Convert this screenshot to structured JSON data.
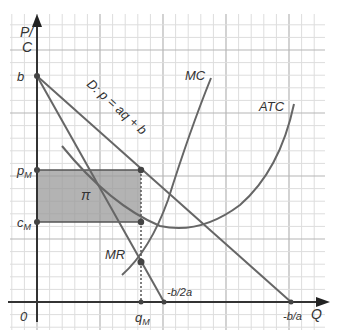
{
  "axes": {
    "y_label_line1": "P/",
    "y_label_line2": "C",
    "x_label": "Q",
    "origin_label": "0"
  },
  "labels": {
    "b": "b",
    "p_m": "p",
    "p_m_sub": "M",
    "c_m": "c",
    "c_m_sub": "M",
    "q_m": "q",
    "q_m_sub": "M",
    "neg_b_2a": "-b/2a",
    "neg_b_a": "-b/a",
    "profit": "π",
    "demand": "D: p = aq + b",
    "mc": "MC",
    "atc": "ATC",
    "mr": "MR"
  },
  "colors": {
    "curve": "#555555",
    "axis": "#333333",
    "grid_minor": "#dddddd",
    "grid_major": "#b5b5b5",
    "profit_fill": "#9a9a9a",
    "point": "#444444"
  },
  "chart_data": {
    "type": "line",
    "title": "",
    "xlabel": "Q",
    "ylabel": "P/C",
    "x_ticks": [
      "0",
      "q_M",
      "-b/2a",
      "-b/a"
    ],
    "y_ticks": [
      "b",
      "p_M",
      "c_M"
    ],
    "series": [
      {
        "name": "D: p = aq + b",
        "kind": "linear",
        "from": [
          "0",
          "b"
        ],
        "to": [
          "-b/a",
          "0"
        ]
      },
      {
        "name": "MR",
        "kind": "linear",
        "from": [
          "0",
          "b"
        ],
        "to": [
          "-b/2a",
          "0"
        ]
      },
      {
        "name": "MC",
        "kind": "curve",
        "note": "upward sloping, intersects MR at q_M"
      },
      {
        "name": "ATC",
        "kind": "curve",
        "note": "U-shaped, value c_M at q_M"
      }
    ],
    "annotations": [
      {
        "label": "π",
        "type": "shaded rectangle",
        "x_range": [
          "0",
          "q_M"
        ],
        "y_range": [
          "c_M",
          "p_M"
        ]
      },
      {
        "label": "q_M",
        "type": "dotted vertical line",
        "from": "p_M on demand",
        "to": "Q axis"
      }
    ],
    "grid": true
  }
}
